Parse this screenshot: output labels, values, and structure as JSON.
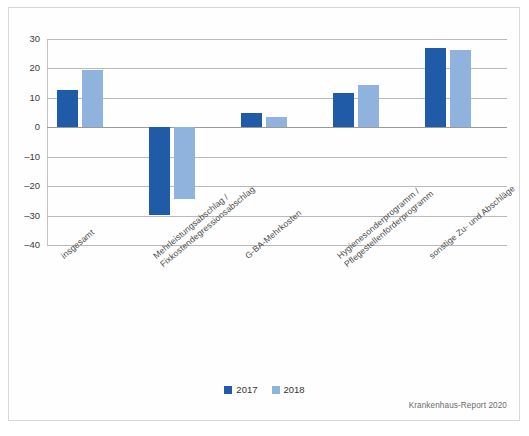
{
  "chart_data": {
    "type": "bar",
    "title": "",
    "subtitle": "",
    "xlabel": "",
    "ylabel": "",
    "ylim": [
      -40,
      30
    ],
    "yticks": [
      30,
      20,
      10,
      0,
      -10,
      -20,
      -30,
      -40
    ],
    "ytick_labels": [
      "30",
      "20",
      "10",
      "0",
      "–10",
      "–20",
      "–30",
      "–40"
    ],
    "grid": true,
    "legend_position": "bottom-center",
    "categories": [
      "insgesamt",
      "Mehrleistungsabschlag /\nFixkostendegressionsabschlag",
      "G-BA-Mehrkosten",
      "Hygienesonderprogramm /\nPflegestellenförderprogramm",
      "sonstige Zu- und Abschläge"
    ],
    "series": [
      {
        "name": "2017",
        "color": "#1f5ba6",
        "values": [
          12.6,
          -29.8,
          4.8,
          11.5,
          27.0
        ]
      },
      {
        "name": "2018",
        "color": "#8fb3dc",
        "values": [
          19.4,
          -24.4,
          3.6,
          14.5,
          26.3
        ]
      }
    ],
    "source": "Krankenhaus-Report 2020"
  },
  "legend": {
    "items": [
      {
        "label": "2017",
        "color": "#1f5ba6"
      },
      {
        "label": "2018",
        "color": "#8fb3dc"
      }
    ]
  },
  "footer": {
    "source": "Krankenhaus-Report 2020"
  }
}
